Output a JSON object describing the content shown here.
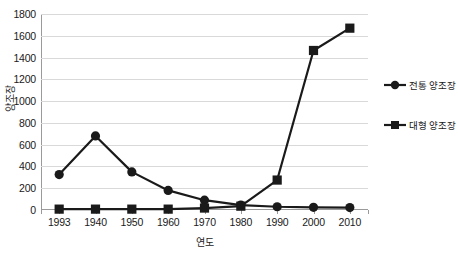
{
  "chart_data": {
    "type": "line",
    "title": "",
    "xlabel": "연도",
    "ylabel": "양조장",
    "categories": [
      "1993",
      "1940",
      "1950",
      "1960",
      "1970",
      "1980",
      "1990",
      "2000",
      "2010"
    ],
    "ylim": [
      0,
      1800
    ],
    "ytick_labels": [
      "0",
      "200",
      "400",
      "600",
      "800",
      "1000",
      "1200",
      "1400",
      "1600",
      "1800"
    ],
    "ytick_values": [
      0,
      200,
      400,
      600,
      800,
      1000,
      1200,
      1400,
      1600,
      1800
    ],
    "grid": true,
    "legend_position": "right",
    "series": [
      {
        "name": "전통 양조장",
        "marker": "circle",
        "color": "#1a1a1a",
        "values": [
          325,
          680,
          350,
          180,
          90,
          45,
          30,
          25,
          22
        ]
      },
      {
        "name": "대형 양조장",
        "marker": "square",
        "color": "#1a1a1a",
        "values": [
          8,
          8,
          8,
          8,
          18,
          35,
          275,
          1465,
          1670
        ]
      }
    ]
  },
  "legend": {
    "items": [
      {
        "label": "전통 양조장",
        "marker": "circle"
      },
      {
        "label": "대형 양조장",
        "marker": "square"
      }
    ]
  },
  "colors": {
    "series": "#1a1a1a",
    "gridline": "#d9d9d9",
    "axis": "#9a9a9a",
    "background": "#ffffff",
    "text": "#1a1a1a"
  }
}
